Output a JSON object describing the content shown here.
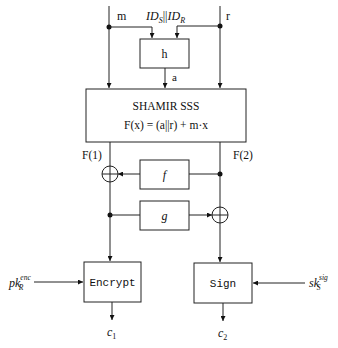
{
  "diagram": {
    "inputs": {
      "m": "m",
      "ids_main": "ID",
      "ids_sub_s": "S",
      "ids_concat": "||",
      "ids_sub_r": "R",
      "r": "r"
    },
    "hash_box": {
      "label": "h",
      "output": "a"
    },
    "shamir": {
      "title": "SHAMIR SSS",
      "formula": "F(x) = (a||r) + m·x",
      "output_left": "F(1)",
      "output_right": "F(2)"
    },
    "f_box": {
      "label": "f"
    },
    "g_box": {
      "label": "g"
    },
    "encrypt": {
      "label": "Encrypt",
      "key_main": "pk",
      "key_sub": "R",
      "key_sup": "enc",
      "output_main": "c",
      "output_sub": "1"
    },
    "sign": {
      "label": "Sign",
      "key_main": "sk",
      "key_sub": "S",
      "key_sup": "sig",
      "output_main": "c",
      "output_sub": "2"
    }
  }
}
